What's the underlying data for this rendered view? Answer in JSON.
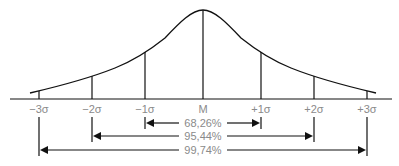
{
  "diagram": {
    "title": "",
    "axis_labels": [
      "−3σ",
      "−2σ",
      "−1σ",
      "M",
      "+1σ",
      "+2σ",
      "+3σ"
    ],
    "intervals": [
      {
        "label": "68,26%",
        "from": "−1σ",
        "to": "+1σ"
      },
      {
        "label": "95,44%",
        "from": "−2σ",
        "to": "+2σ"
      },
      {
        "label": "99,74%",
        "from": "−3σ",
        "to": "+3σ"
      }
    ],
    "colors": {
      "line": "#111111",
      "text": "#8a8a8a"
    }
  }
}
